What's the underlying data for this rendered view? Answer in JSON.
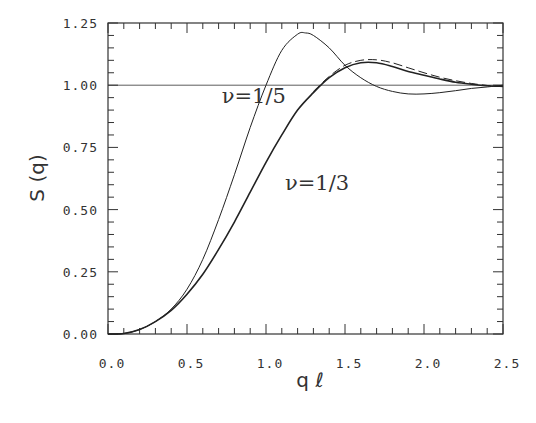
{
  "chart_data": {
    "type": "line",
    "title": "",
    "xlabel": "q ℓ",
    "ylabel": "S (q)",
    "xlim": [
      0.0,
      2.5
    ],
    "ylim": [
      0.0,
      1.25
    ],
    "x_ticks": [
      "0.0",
      "0.5",
      "1.0",
      "1.5",
      "2.0",
      "2.5"
    ],
    "y_ticks": [
      "0.00",
      "0.25",
      "0.50",
      "0.75",
      "1.00",
      "1.25"
    ],
    "x_minor_step": 0.1,
    "y_minor_step": 0.05,
    "grid": false,
    "reference_line": {
      "y": 1.0
    },
    "annotations": [
      {
        "text": "ν=1/5",
        "x": 0.72,
        "y": 0.93
      },
      {
        "text": "ν=1/3",
        "x": 1.12,
        "y": 0.58
      }
    ],
    "series": [
      {
        "name": "ν=1/5",
        "style": "solid-thin",
        "x": [
          0.0,
          0.1,
          0.2,
          0.3,
          0.4,
          0.5,
          0.6,
          0.7,
          0.8,
          0.9,
          1.0,
          1.1,
          1.2,
          1.25,
          1.3,
          1.4,
          1.5,
          1.6,
          1.7,
          1.8,
          1.9,
          2.0,
          2.1,
          2.2,
          2.3,
          2.4,
          2.5
        ],
        "values": [
          0.0,
          0.002,
          0.018,
          0.05,
          0.1,
          0.18,
          0.3,
          0.46,
          0.64,
          0.83,
          1.0,
          1.14,
          1.205,
          1.21,
          1.2,
          1.15,
          1.08,
          1.03,
          0.995,
          0.975,
          0.965,
          0.965,
          0.97,
          0.978,
          0.987,
          0.993,
          1.0
        ]
      },
      {
        "name": "ν=1/3",
        "style": "solid-thick",
        "x": [
          0.0,
          0.1,
          0.2,
          0.3,
          0.4,
          0.5,
          0.6,
          0.7,
          0.8,
          0.9,
          1.0,
          1.1,
          1.2,
          1.3,
          1.4,
          1.5,
          1.6,
          1.7,
          1.8,
          1.9,
          2.0,
          2.1,
          2.2,
          2.3,
          2.4,
          2.5
        ],
        "values": [
          0.0,
          0.002,
          0.018,
          0.05,
          0.095,
          0.16,
          0.24,
          0.34,
          0.45,
          0.57,
          0.69,
          0.8,
          0.9,
          0.97,
          1.03,
          1.07,
          1.09,
          1.09,
          1.075,
          1.055,
          1.04,
          1.025,
          1.012,
          1.004,
          0.998,
          0.995
        ]
      },
      {
        "name": "ν=1/3 (dashed)",
        "style": "dashed",
        "x": [
          1.3,
          1.4,
          1.5,
          1.6,
          1.7,
          1.8,
          1.9,
          2.0,
          2.1,
          2.2,
          2.3,
          2.4,
          2.5
        ],
        "values": [
          0.975,
          1.035,
          1.08,
          1.1,
          1.102,
          1.09,
          1.07,
          1.05,
          1.032,
          1.018,
          1.007,
          0.999,
          0.995
        ]
      }
    ]
  }
}
